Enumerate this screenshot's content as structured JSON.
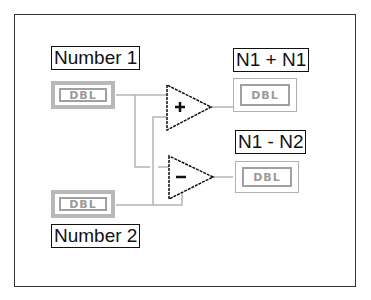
{
  "diagram": {
    "inputs": [
      {
        "label": "Number 1",
        "type": "DBL"
      },
      {
        "label": "Number 2",
        "type": "DBL"
      }
    ],
    "operators": [
      {
        "name": "add",
        "symbol": "+"
      },
      {
        "name": "subtract",
        "symbol": "-"
      }
    ],
    "outputs": [
      {
        "label": "N1 + N1",
        "type": "DBL"
      },
      {
        "label": "N1 - N2",
        "type": "DBL"
      }
    ],
    "colors": {
      "wire": "#b4b4b4",
      "border": "#111111",
      "terminal": "#a0a0a0"
    }
  }
}
